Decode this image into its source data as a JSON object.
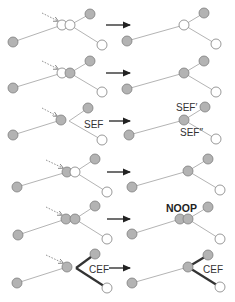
{
  "diagram": {
    "width": 235,
    "height": 302,
    "colors": {
      "gray_node": "#b3b3b3",
      "white_node": "#ffffff",
      "node_stroke": "#7f7f7f",
      "edge": "#b4b4b4",
      "bold_edge": "#333333",
      "arrow": "#222222"
    },
    "node_radius": 5,
    "rows": [
      {
        "id": "row1",
        "before": {
          "nodes": [
            {
              "x": 13,
              "y": 42,
              "fill": "gray"
            },
            {
              "x": 62,
              "y": 25,
              "fill": "white"
            },
            {
              "x": 70,
              "y": 25,
              "fill": "white"
            },
            {
              "x": 90,
              "y": 14,
              "fill": "gray"
            },
            {
              "x": 102,
              "y": 45,
              "fill": "white"
            }
          ],
          "edges": [
            {
              "x1": 13,
              "y1": 42,
              "x2": 62,
              "y2": 25,
              "bold": false
            },
            {
              "x1": 70,
              "y1": 25,
              "x2": 90,
              "y2": 14,
              "bold": false
            },
            {
              "x1": 70,
              "y1": 25,
              "x2": 102,
              "y2": 45,
              "bold": false
            }
          ],
          "pointer": {
            "x1": 42,
            "y1": 13,
            "x2": 58,
            "y2": 21
          },
          "labels": []
        },
        "arrow": {
          "x1": 106,
          "y1": 25,
          "x2": 130,
          "y2": 25
        },
        "after": {
          "nodes": [
            {
              "x": 127,
              "y": 41,
              "fill": "gray"
            },
            {
              "x": 184,
              "y": 25,
              "fill": "white"
            },
            {
              "x": 204,
              "y": 13,
              "fill": "gray"
            },
            {
              "x": 216,
              "y": 44,
              "fill": "white"
            }
          ],
          "edges": [
            {
              "x1": 127,
              "y1": 41,
              "x2": 184,
              "y2": 25,
              "bold": false
            },
            {
              "x1": 184,
              "y1": 25,
              "x2": 204,
              "y2": 13,
              "bold": false
            },
            {
              "x1": 184,
              "y1": 25,
              "x2": 216,
              "y2": 44,
              "bold": false
            }
          ],
          "labels": []
        }
      },
      {
        "id": "row2",
        "before": {
          "nodes": [
            {
              "x": 13,
              "y": 88,
              "fill": "gray"
            },
            {
              "x": 62,
              "y": 73,
              "fill": "white"
            },
            {
              "x": 70,
              "y": 73,
              "fill": "gray"
            },
            {
              "x": 90,
              "y": 61,
              "fill": "gray"
            },
            {
              "x": 102,
              "y": 92,
              "fill": "white"
            }
          ],
          "edges": [
            {
              "x1": 13,
              "y1": 88,
              "x2": 62,
              "y2": 73,
              "bold": false
            },
            {
              "x1": 70,
              "y1": 73,
              "x2": 90,
              "y2": 61,
              "bold": false
            },
            {
              "x1": 70,
              "y1": 73,
              "x2": 102,
              "y2": 92,
              "bold": false
            }
          ],
          "pointer": {
            "x1": 42,
            "y1": 61,
            "x2": 58,
            "y2": 69
          },
          "labels": []
        },
        "arrow": {
          "x1": 106,
          "y1": 73,
          "x2": 130,
          "y2": 73
        },
        "after": {
          "nodes": [
            {
              "x": 127,
              "y": 89,
              "fill": "gray"
            },
            {
              "x": 184,
              "y": 73,
              "fill": "gray"
            },
            {
              "x": 204,
              "y": 61,
              "fill": "gray"
            },
            {
              "x": 216,
              "y": 92,
              "fill": "white"
            }
          ],
          "edges": [
            {
              "x1": 127,
              "y1": 89,
              "x2": 184,
              "y2": 73,
              "bold": false
            },
            {
              "x1": 184,
              "y1": 73,
              "x2": 204,
              "y2": 61,
              "bold": false
            },
            {
              "x1": 184,
              "y1": 73,
              "x2": 216,
              "y2": 92,
              "bold": false
            }
          ],
          "labels": []
        }
      },
      {
        "id": "row3",
        "before": {
          "nodes": [
            {
              "x": 13,
              "y": 135,
              "fill": "gray"
            },
            {
              "x": 61,
              "y": 120,
              "fill": "gray"
            },
            {
              "x": 88,
              "y": 108,
              "fill": "gray"
            },
            {
              "x": 102,
              "y": 140,
              "fill": "white"
            }
          ],
          "edges": [
            {
              "x1": 13,
              "y1": 135,
              "x2": 61,
              "y2": 120,
              "bold": false
            },
            {
              "x1": 69,
              "y1": 121,
              "x2": 88,
              "y2": 108,
              "bold": false
            },
            {
              "x1": 69,
              "y1": 121,
              "x2": 102,
              "y2": 140,
              "bold": false
            }
          ],
          "pointer": {
            "x1": 42,
            "y1": 108,
            "x2": 57,
            "y2": 116
          },
          "labels": [
            {
              "x": 84,
              "y": 128,
              "text": "SEF",
              "bold": false
            }
          ]
        },
        "arrow": {
          "x1": 109,
          "y1": 121,
          "x2": 130,
          "y2": 121
        },
        "after": {
          "nodes": [
            {
              "x": 129,
              "y": 135,
              "fill": "gray"
            },
            {
              "x": 184,
              "y": 120,
              "fill": "gray"
            },
            {
              "x": 205,
              "y": 107,
              "fill": "gray"
            },
            {
              "x": 216,
              "y": 139,
              "fill": "white"
            }
          ],
          "edges": [
            {
              "x1": 129,
              "y1": 135,
              "x2": 184,
              "y2": 120,
              "bold": false
            },
            {
              "x1": 184,
              "y1": 120,
              "x2": 205,
              "y2": 107,
              "bold": false
            },
            {
              "x1": 184,
              "y1": 120,
              "x2": 216,
              "y2": 139,
              "bold": false
            }
          ],
          "labels": [
            {
              "x": 176,
              "y": 111,
              "text": "SEF′",
              "bold": false
            },
            {
              "x": 180,
              "y": 136,
              "text": "SEF″",
              "bold": false
            }
          ]
        }
      },
      {
        "id": "row4",
        "before": {
          "nodes": [
            {
              "x": 17,
              "y": 187,
              "fill": "gray"
            },
            {
              "x": 67,
              "y": 172,
              "fill": "gray"
            },
            {
              "x": 75,
              "y": 172,
              "fill": "white"
            },
            {
              "x": 95,
              "y": 159,
              "fill": "gray"
            },
            {
              "x": 107,
              "y": 192,
              "fill": "white"
            }
          ],
          "edges": [
            {
              "x1": 17,
              "y1": 187,
              "x2": 67,
              "y2": 172,
              "bold": false
            },
            {
              "x1": 75,
              "y1": 172,
              "x2": 95,
              "y2": 159,
              "bold": false
            },
            {
              "x1": 75,
              "y1": 172,
              "x2": 107,
              "y2": 192,
              "bold": false
            }
          ],
          "pointer": {
            "x1": 46,
            "y1": 160,
            "x2": 63,
            "y2": 168
          },
          "labels": []
        },
        "arrow": {
          "x1": 107,
          "y1": 172,
          "x2": 130,
          "y2": 172
        },
        "after": {
          "nodes": [
            {
              "x": 132,
              "y": 187,
              "fill": "gray"
            },
            {
              "x": 188,
              "y": 171,
              "fill": "gray"
            },
            {
              "x": 208,
              "y": 159,
              "fill": "gray"
            },
            {
              "x": 220,
              "y": 190,
              "fill": "white"
            }
          ],
          "edges": [
            {
              "x1": 132,
              "y1": 187,
              "x2": 188,
              "y2": 171,
              "bold": false
            },
            {
              "x1": 188,
              "y1": 171,
              "x2": 208,
              "y2": 159,
              "bold": false
            },
            {
              "x1": 188,
              "y1": 171,
              "x2": 220,
              "y2": 190,
              "bold": false
            }
          ],
          "labels": []
        }
      },
      {
        "id": "row5",
        "before": {
          "nodes": [
            {
              "x": 18,
              "y": 235,
              "fill": "gray"
            },
            {
              "x": 66,
              "y": 219,
              "fill": "gray"
            },
            {
              "x": 75,
              "y": 219,
              "fill": "gray"
            },
            {
              "x": 95,
              "y": 206,
              "fill": "gray"
            },
            {
              "x": 107,
              "y": 239,
              "fill": "white"
            }
          ],
          "edges": [
            {
              "x1": 18,
              "y1": 235,
              "x2": 66,
              "y2": 219,
              "bold": false
            },
            {
              "x1": 75,
              "y1": 219,
              "x2": 95,
              "y2": 206,
              "bold": false
            },
            {
              "x1": 75,
              "y1": 219,
              "x2": 107,
              "y2": 239,
              "bold": false
            }
          ],
          "pointer": {
            "x1": 46,
            "y1": 207,
            "x2": 62,
            "y2": 215
          },
          "labels": []
        },
        "arrow": {
          "x1": 107,
          "y1": 219,
          "x2": 130,
          "y2": 219
        },
        "after": {
          "nodes": [
            {
              "x": 132,
              "y": 234,
              "fill": "gray"
            },
            {
              "x": 180,
              "y": 219,
              "fill": "gray"
            },
            {
              "x": 188,
              "y": 219,
              "fill": "gray"
            },
            {
              "x": 208,
              "y": 207,
              "fill": "gray"
            },
            {
              "x": 220,
              "y": 239,
              "fill": "white"
            }
          ],
          "edges": [
            {
              "x1": 132,
              "y1": 234,
              "x2": 180,
              "y2": 219,
              "bold": false
            },
            {
              "x1": 188,
              "y1": 219,
              "x2": 208,
              "y2": 207,
              "bold": false
            },
            {
              "x1": 188,
              "y1": 219,
              "x2": 220,
              "y2": 239,
              "bold": false
            }
          ],
          "labels": [
            {
              "x": 166,
              "y": 212,
              "text": "NOOP",
              "bold": true
            }
          ]
        }
      },
      {
        "id": "row6",
        "before": {
          "nodes": [
            {
              "x": 17,
              "y": 283,
              "fill": "gray"
            },
            {
              "x": 67,
              "y": 267,
              "fill": "gray"
            },
            {
              "x": 95,
              "y": 254,
              "fill": "gray"
            },
            {
              "x": 107,
              "y": 288,
              "fill": "white"
            }
          ],
          "edges": [
            {
              "x1": 17,
              "y1": 283,
              "x2": 67,
              "y2": 267,
              "bold": false
            },
            {
              "x1": 76,
              "y1": 268,
              "x2": 95,
              "y2": 254,
              "bold": true
            },
            {
              "x1": 76,
              "y1": 268,
              "x2": 107,
              "y2": 288,
              "bold": true
            }
          ],
          "pointer": {
            "x1": 46,
            "y1": 255,
            "x2": 63,
            "y2": 263
          },
          "labels": [
            {
              "x": 89,
              "y": 273,
              "text": "CEF",
              "bold": false
            }
          ]
        },
        "arrow": {
          "x1": 109,
          "y1": 268,
          "x2": 130,
          "y2": 268
        },
        "after": {
          "nodes": [
            {
              "x": 132,
              "y": 283,
              "fill": "gray"
            },
            {
              "x": 188,
              "y": 267,
              "fill": "gray"
            },
            {
              "x": 208,
              "y": 255,
              "fill": "gray"
            },
            {
              "x": 220,
              "y": 287,
              "fill": "white"
            }
          ],
          "edges": [
            {
              "x1": 132,
              "y1": 283,
              "x2": 188,
              "y2": 267,
              "bold": false
            },
            {
              "x1": 188,
              "y1": 267,
              "x2": 208,
              "y2": 255,
              "bold": true
            },
            {
              "x1": 188,
              "y1": 267,
              "x2": 220,
              "y2": 287,
              "bold": true
            }
          ],
          "labels": [
            {
              "x": 203,
              "y": 273,
              "text": "CEF",
              "bold": false
            }
          ]
        }
      }
    ]
  }
}
